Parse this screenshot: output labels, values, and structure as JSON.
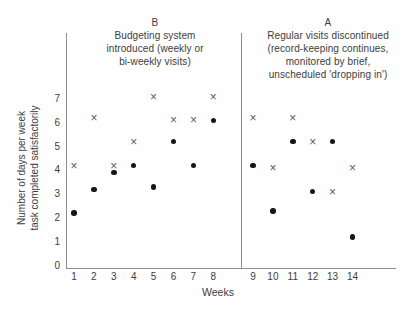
{
  "chart_data": {
    "type": "scatter",
    "xlabel": "Weeks",
    "ylabel": "Number of days per week\ntask completed satisfactorily",
    "ylim": [
      0,
      7
    ],
    "y_ticks": [
      0,
      1,
      2,
      3,
      4,
      5,
      6,
      7
    ],
    "weeks": [
      1,
      2,
      3,
      4,
      5,
      6,
      7,
      8,
      9,
      10,
      11,
      12,
      13,
      14
    ],
    "grid": false,
    "legend": "none",
    "phases": [
      {
        "label": "B",
        "description": "Budgeting system\nintroduced (weekly or\nbi-weekly visits)",
        "weeks_range": [
          1,
          8
        ]
      },
      {
        "label": "A",
        "description": "Regular visits discontinued\n(record-keeping continues,\nmonitored by brief,\nunscheduled 'dropping in')",
        "weeks_range": [
          9,
          14
        ]
      }
    ],
    "phase_divider_after_week": 8,
    "series": [
      {
        "name": "x-marker-series",
        "marker": "x",
        "color": "#5a5a5a",
        "values": [
          4.2,
          6.2,
          4.2,
          5.2,
          7.1,
          6.1,
          6.1,
          7.1,
          6.2,
          4.1,
          6.2,
          5.2,
          3.1,
          4.1
        ]
      },
      {
        "name": "dot-marker-series",
        "marker": "dot",
        "color": "#161616",
        "values": [
          2.2,
          3.2,
          3.9,
          4.2,
          3.3,
          5.2,
          4.2,
          6.1,
          4.2,
          2.3,
          5.2,
          3.1,
          5.2,
          1.2
        ]
      }
    ],
    "colors": {
      "axis": "#8f8f8f",
      "text": "#3d3d3d",
      "background": "#fefefe"
    }
  }
}
